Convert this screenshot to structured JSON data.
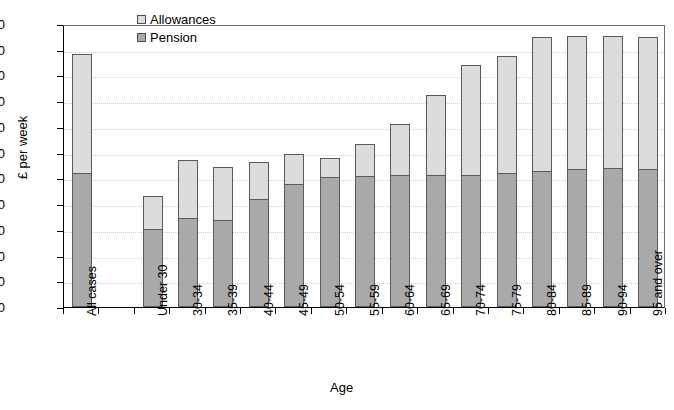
{
  "chart_data": {
    "type": "bar",
    "subtype": "stacked-vertical",
    "title": "",
    "xlabel": "Age",
    "ylabel": "£ per week",
    "ylim": [
      0,
      220
    ],
    "ytick_step": 20,
    "yticks": [
      220,
      200,
      180,
      160,
      140,
      120,
      100,
      80,
      60,
      40,
      20,
      0
    ],
    "grid": true,
    "grid_axis": "y",
    "legend_position": "top-center",
    "categories": [
      "All cases",
      "",
      "Under 30",
      "30-34",
      "35-39",
      "40-44",
      "45-49",
      "50-54",
      "55-59",
      "60-64",
      "65-69",
      "70-74",
      "75-79",
      "80-84",
      "85-89",
      "90-94",
      "95 and over"
    ],
    "series": [
      {
        "name": "Pension",
        "color": "#a9a9a9",
        "values": [
          104,
          null,
          61,
          69,
          68,
          84,
          96,
          101,
          102,
          103,
          103,
          103,
          104,
          106,
          107,
          108,
          107
        ]
      },
      {
        "name": "Allowances",
        "color": "#dcdcdc",
        "values": [
          93,
          null,
          25,
          45,
          41,
          29,
          23,
          15,
          25,
          39,
          62,
          85,
          91,
          104,
          104,
          103,
          103
        ]
      }
    ],
    "totals": [
      197,
      null,
      86,
      114,
      109,
      113,
      119,
      116,
      127,
      142,
      165,
      188,
      195,
      210,
      211,
      211,
      210
    ]
  },
  "legend": {
    "items": [
      {
        "label": "Allowances",
        "color": "#dcdcdc"
      },
      {
        "label": "Pension",
        "color": "#a9a9a9"
      }
    ]
  },
  "axes": {
    "y_title": "£ per week",
    "x_title": "Age"
  },
  "colors": {
    "allowances": "#dcdcdc",
    "pension": "#a9a9a9",
    "bar_outline": "#5a5a5a",
    "axis": "#000000",
    "gridline": "#cfcfcf",
    "background": "#ffffff"
  }
}
